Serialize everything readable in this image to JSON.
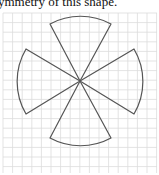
{
  "caption": {
    "text": "ymmetry of this shape."
  },
  "figure": {
    "grid_color": "#dcdcdc",
    "stroke_color": "#555555",
    "center": [
      80,
      91
    ],
    "sectors": [
      {
        "name": "top",
        "from": [
          50,
          34
        ],
        "to": [
          111,
          34
        ]
      },
      {
        "name": "right",
        "from": [
          134,
          60
        ],
        "to": [
          134,
          124
        ]
      },
      {
        "name": "bottom",
        "from": [
          111,
          148
        ],
        "to": [
          50,
          148
        ]
      },
      {
        "name": "left",
        "from": [
          26,
          124
        ],
        "to": [
          26,
          60
        ]
      }
    ]
  }
}
